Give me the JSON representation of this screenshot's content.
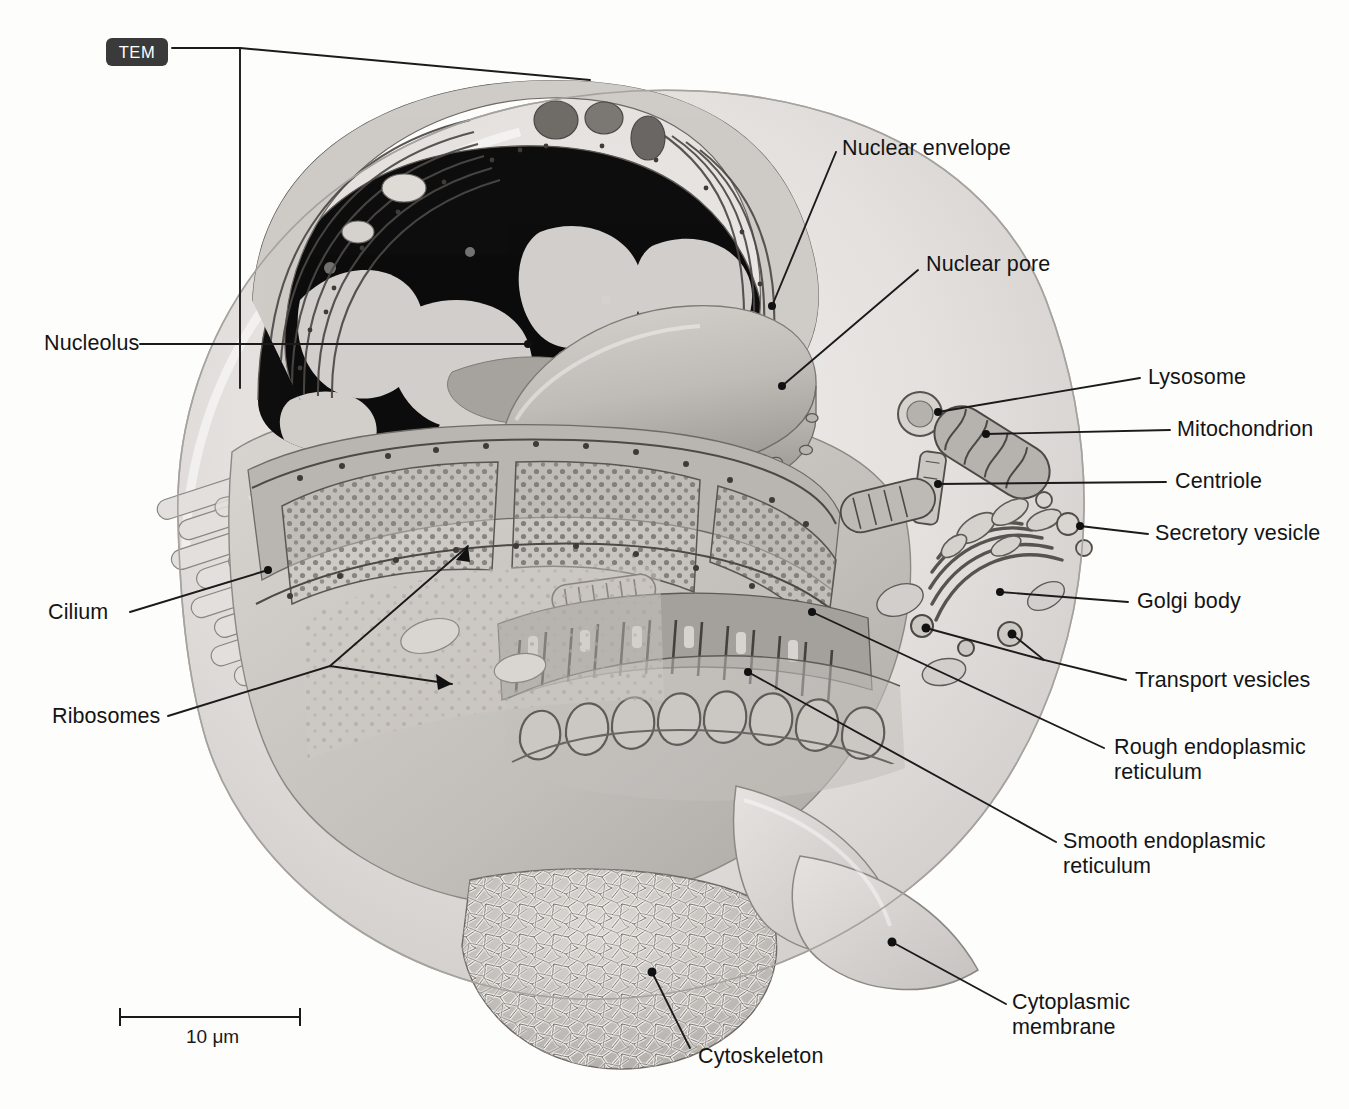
{
  "figure": {
    "type": "labeled-diagram",
    "badge": {
      "label": "TEM"
    },
    "scale_bar": {
      "label": "10 μm",
      "length_px": 180
    }
  },
  "labels": {
    "nuclear_envelope": "Nuclear envelope",
    "nuclear_pore": "Nuclear pore",
    "nucleolus": "Nucleolus",
    "lysosome": "Lysosome",
    "mitochondrion": "Mitochondrion",
    "centriole": "Centriole",
    "secretory_vesicle": "Secretory vesicle",
    "golgi_body": "Golgi body",
    "transport_vesicles": "Transport vesicles",
    "rough_er": "Rough endoplasmic\nreticulum",
    "smooth_er": "Smooth endoplasmic\nreticulum",
    "cilium": "Cilium",
    "ribosomes": "Ribosomes",
    "cytoskeleton": "Cytoskeleton",
    "cytoplasmic_membrane": "Cytoplasmic\nmembrane"
  },
  "colors": {
    "background": "#fdfdfc",
    "leader_line": "#1b1b1b",
    "text": "#141414",
    "badge_bg": "#3a3a3a",
    "badge_text": "#ffffff",
    "cell_light": "#e9e7e5",
    "cell_mid": "#c9c6c3",
    "cell_dark": "#8d8a87",
    "nucleus_dark": "#111111",
    "chromatin_light": "#e6e4e1"
  }
}
